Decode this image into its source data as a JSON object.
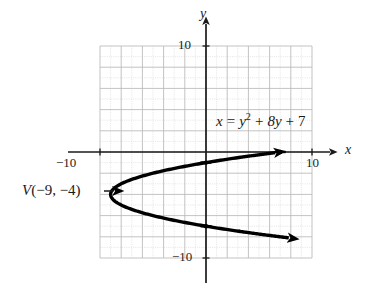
{
  "chart_data": {
    "type": "line",
    "title": "",
    "subtitle": "",
    "xlabel": "x",
    "ylabel": "y",
    "xlim": [
      -10,
      10
    ],
    "ylim": [
      -10,
      10
    ],
    "grid": true,
    "grid_step": 1,
    "grid_major_step": 2,
    "legend": "none",
    "equation_text": "x = y² + 8y + 7",
    "equation_parts": {
      "lhs": "x",
      "eq": "=",
      "var": "y",
      "exponent": "2",
      "plus1": "+",
      "term2": "8y",
      "plus2": "+",
      "constant": "7"
    },
    "vertex_label": "V(−9, −4)",
    "vertex": {
      "x": -9,
      "y": -4
    },
    "curve": {
      "name": "parabola-x-equals-y-squared-plus-8y-plus-7",
      "orientation": "opens-right",
      "axis_of_symmetry_y": -4,
      "x_intercept": 7,
      "y_intercepts": [
        -1,
        -7
      ],
      "sampled_points": [
        {
          "x": 7,
          "y": 0
        },
        {
          "x": 0,
          "y": -1
        },
        {
          "x": -5,
          "y": -2
        },
        {
          "x": -8,
          "y": -3
        },
        {
          "x": -9,
          "y": -4
        },
        {
          "x": -8,
          "y": -5
        },
        {
          "x": -5,
          "y": -6
        },
        {
          "x": 0,
          "y": -7
        },
        {
          "x": 7,
          "y": -8
        },
        {
          "x": 12,
          "y": -8.6
        }
      ]
    },
    "marked_points": [
      {
        "x": 7,
        "y": 0,
        "label": ""
      },
      {
        "x": 0,
        "y": -1,
        "label": ""
      },
      {
        "x": -9,
        "y": -4,
        "label": "V(−9, −4)"
      },
      {
        "x": 0,
        "y": -7,
        "label": ""
      }
    ],
    "x_tick_labels": [
      {
        "value": -10,
        "text": "−10"
      },
      {
        "value": 10,
        "text": "10"
      }
    ],
    "y_tick_labels": [
      {
        "value": 10,
        "text": "10"
      },
      {
        "value": -10,
        "text": "−10"
      }
    ],
    "axis_arrows": [
      "x-positive",
      "y-positive"
    ],
    "curve_arrows": [
      "upper-right",
      "lower-right"
    ]
  },
  "colors": {
    "background": "#ffffff",
    "grid_minor": "#d8d8d8",
    "grid_major": "#b4b4b4",
    "axis": "#1a1a1a",
    "curve": "#000000",
    "text": "#1a1a1a"
  },
  "labels": {
    "x_axis": "x",
    "y_axis": "y",
    "x_neg_ten": "−10",
    "x_pos_ten": "10",
    "y_pos_ten": "10",
    "y_neg_ten": "−10",
    "vertex": "V(−9, −4)",
    "vertex_v": "V",
    "vertex_coords": "(−9, −4)",
    "equation": "x = y² + 8y + 7"
  }
}
